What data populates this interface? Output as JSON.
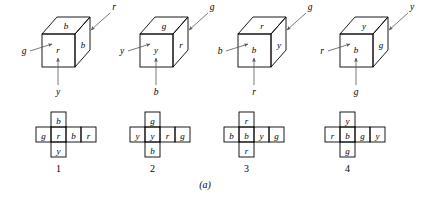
{
  "figure": {
    "caption": "(a)",
    "cubes": [
      {
        "number": "1",
        "faces": {
          "top": "b",
          "front": "r",
          "right": "b"
        },
        "arrows": {
          "left": "g",
          "upper_right": "r",
          "bottom": "y"
        }
      },
      {
        "number": "2",
        "faces": {
          "top": "g",
          "front": "y",
          "right": "r"
        },
        "arrows": {
          "left": "y",
          "upper_right": "g",
          "bottom": "b"
        }
      },
      {
        "number": "3",
        "faces": {
          "top": "r",
          "front": "b",
          "right": "y"
        },
        "arrows": {
          "left": "b",
          "upper_right": "g",
          "bottom": "r"
        }
      },
      {
        "number": "4",
        "faces": {
          "top": "y",
          "front": "b",
          "right": "g"
        },
        "arrows": {
          "left": "r",
          "upper_right": "y",
          "bottom": "g"
        }
      }
    ],
    "nets": [
      {
        "number": "1",
        "top": "b",
        "row": [
          "g",
          "r",
          "b",
          "r"
        ],
        "bottom": "y"
      },
      {
        "number": "2",
        "top": "g",
        "row": [
          "y",
          "y",
          "r",
          "g"
        ],
        "bottom": "b"
      },
      {
        "number": "3",
        "top": "r",
        "row": [
          "b",
          "b",
          "y",
          "g"
        ],
        "bottom": "r"
      },
      {
        "number": "4",
        "top": "y",
        "row": [
          "r",
          "b",
          "g",
          "y"
        ],
        "bottom": "g"
      }
    ]
  }
}
